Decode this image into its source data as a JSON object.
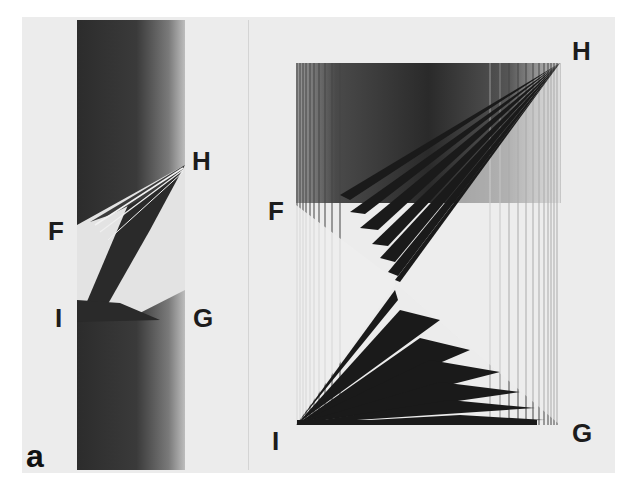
{
  "figure": {
    "panel_label": "a",
    "left_panel": {
      "description": "photograph of vertical strip with diffraction fan between F, H, I, G",
      "labels": {
        "H": "H",
        "F": "F",
        "I": "I",
        "G": "G"
      }
    },
    "right_panel": {
      "description": "computed interference pattern inside rectangle F-H-G-I with two fans meeting at center",
      "labels": {
        "H": "H",
        "F": "F",
        "I": "I",
        "G": "G"
      }
    },
    "colors": {
      "paper": "#ececec",
      "ink": "#1c1c1c",
      "dark_band": "#3a3a3a"
    }
  }
}
